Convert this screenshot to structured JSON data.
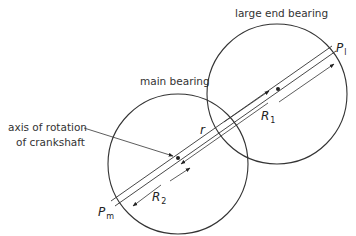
{
  "labels": {
    "large_end_bearing": "large end bearing",
    "main_bearing": "main bearing",
    "axis_line1": "axis of rotation",
    "axis_line2": "of crankshaft"
  },
  "symbols": {
    "P_l": {
      "base": "P",
      "sub": "l"
    },
    "P_m": {
      "base": "P",
      "sub": "m"
    },
    "R_1": {
      "base": "R",
      "sub": "1"
    },
    "R_2": {
      "base": "R",
      "sub": "2"
    },
    "r": {
      "base": "r"
    }
  },
  "colors": {
    "stroke": "#333333",
    "text": "#333333"
  }
}
